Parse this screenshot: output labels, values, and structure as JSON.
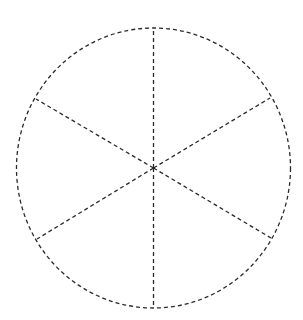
{
  "diagram": {
    "type": "segmented-circle",
    "segments": 6,
    "stroke_color": "#2a2a2a",
    "stroke_style": "dashed",
    "background_color": "#ffffff",
    "circle": {
      "cx": 153.5,
      "cy": 168,
      "rx": 137,
      "ry": 140
    },
    "spokes": [
      {
        "x2": 153.5,
        "y2": 28
      },
      {
        "x2": 270,
        "y2": 98
      },
      {
        "x2": 271,
        "y2": 238
      },
      {
        "x2": 153.5,
        "y2": 308
      },
      {
        "x2": 37,
        "y2": 239
      },
      {
        "x2": 36,
        "y2": 99
      }
    ]
  }
}
